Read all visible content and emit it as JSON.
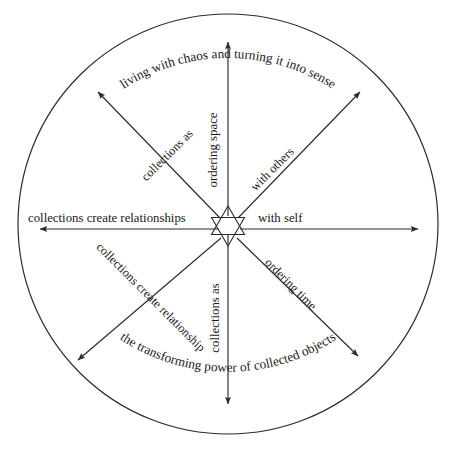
{
  "diagram": {
    "shape": "circle",
    "center_symbol": "star-of-david",
    "stroke_color": "#2b2b2b",
    "background_color": "#ffffff",
    "arc_labels": {
      "top": "living with chaos and turning it into sense",
      "bottom": "the transforming power of collected objects"
    },
    "axes": {
      "up": "ordering space",
      "down": "collections as",
      "left": "collections create relationships",
      "right": "with self",
      "upper_left": "collections as",
      "upper_right": "with others",
      "lower_left": "collections create relationship",
      "lower_right": "ordering time"
    }
  }
}
